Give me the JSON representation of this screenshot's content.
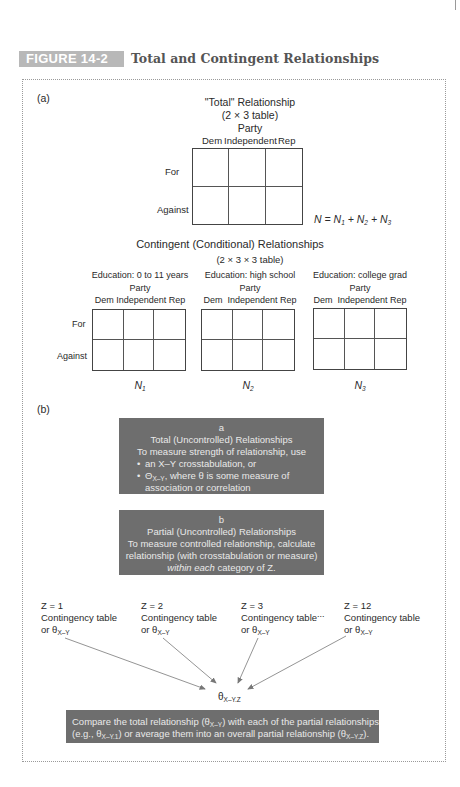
{
  "figure": {
    "label": "FIGURE 14-2",
    "title": "Total and Contingent Relationships",
    "badge_color": "#b8b8b8",
    "box_color": "#6e6e6e"
  },
  "panel_a": {
    "label": "(a)",
    "total": {
      "title": "\"Total\" Relationship",
      "subtitle": "(2 × 3 table)",
      "party_label": "Party",
      "columns": [
        "Dem",
        "Independent",
        "Rep"
      ],
      "rows": [
        "For",
        "Against"
      ],
      "equation": {
        "N": "N",
        "eq": " = ",
        "n1": "N",
        "s1": "1",
        "plus1": " + ",
        "n2": "N",
        "s2": "2",
        "plus2": " + ",
        "n3": "N",
        "s3": "3"
      }
    },
    "contingent": {
      "title": "Contingent (Conditional) Relationships",
      "subtitle": "(2 × 3 × 3 table)",
      "rows": [
        "For",
        "Against"
      ],
      "tables": [
        {
          "education": "Education: 0 to 11 years",
          "party_label": "Party",
          "columns_text": "Dem Independent Rep",
          "n": "N",
          "n_sub": "1"
        },
        {
          "education": "Education: high school",
          "party_label": "Party",
          "columns_text": "Dem  Independent Rep",
          "n": "N",
          "n_sub": "2"
        },
        {
          "education": "Education: college grad",
          "party_label": "Party",
          "columns_text": "Dem  Independent Rep",
          "n": "N",
          "n_sub": "3"
        }
      ]
    }
  },
  "panel_b": {
    "label": "(b)",
    "box_a": {
      "letter": "a",
      "title": "Total (Uncontrolled) Relationships",
      "intro": "To measure strength of relationship, use",
      "bullet1": "an X–Y crosstabulation, or",
      "bullet2_sym": "Θ",
      "bullet2_sub": "X–Y",
      "bullet2_rest": ", where θ is some measure of",
      "bullet2_cont": "association or correlation"
    },
    "box_b": {
      "letter": "b",
      "title": "Partial (Uncontrolled) Relationships",
      "line1": "To measure controlled relationship, calculate",
      "line2": "relationship (with crosstabulation or measure)",
      "line3_italic": "within each",
      "line3_rest": " category of Z."
    },
    "categories": [
      {
        "z": "Z = 1",
        "line1": "Contingency table",
        "or": "or θ",
        "sub": "X–Y"
      },
      {
        "z": "Z = 2",
        "line1": "Contingency table",
        "or": "or θ",
        "sub": "X–Y"
      },
      {
        "z": "Z = 3",
        "line1": "Contingency table",
        "or": "or θ",
        "sub": "X–Y"
      },
      {
        "z": "Z = 12",
        "line1": "Contingency table",
        "or": "or θ",
        "sub": "X–Y"
      }
    ],
    "ellipsis": "...",
    "result": {
      "sym": "θ",
      "sub": "X–Y.Z"
    },
    "summary": {
      "p1": "Compare the total relationship (θ",
      "s1": "X–Y",
      "p2": ") with each of the partial relationships",
      "p3": "(e.g., θ",
      "s2": "X–Y.1",
      "p4": ") or average them into an overall partial relationship (θ",
      "s3": "X–Y.Z",
      "p5": ")."
    }
  }
}
